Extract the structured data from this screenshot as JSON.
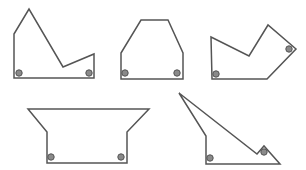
{
  "diagram": {
    "colors": {
      "stroke": "#555555",
      "dot_fill": "#8a8a8a",
      "background": "#ffffff"
    },
    "shapes": [
      {
        "id": "shape-1",
        "points": "14,34 29,9 63,67 94,54 94,78 14,78",
        "dots": [
          [
            19,
            73
          ],
          [
            89,
            73
          ]
        ]
      },
      {
        "id": "shape-2",
        "points": "121,53 141,20 168,20 183,53 183,79 121,79",
        "dots": [
          [
            125,
            73
          ],
          [
            177,
            73
          ]
        ]
      },
      {
        "id": "shape-3",
        "points": "211,37 249,56 268,25 296,49 267,79 212,79",
        "dots": [
          [
            216,
            74
          ],
          [
            289,
            49
          ]
        ]
      },
      {
        "id": "shape-4",
        "points": "28,109 149,109 127,132 127,163 47,163 47,132",
        "dots": [
          [
            51,
            157
          ],
          [
            121,
            157
          ]
        ]
      },
      {
        "id": "shape-5",
        "points": "179,93 257,154 264,146 280,164 206,164 206,136",
        "dots": [
          [
            210,
            158
          ],
          [
            264,
            152
          ]
        ]
      }
    ]
  }
}
